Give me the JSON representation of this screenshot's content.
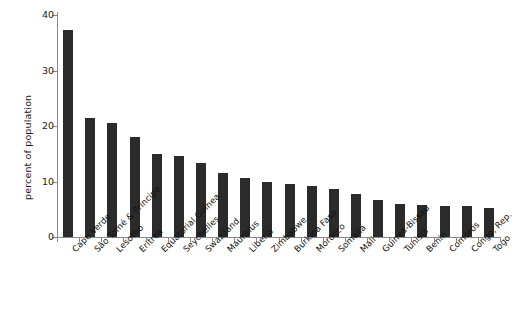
{
  "chart_data": {
    "type": "bar",
    "title": "",
    "xlabel": "",
    "ylabel": "percent of population",
    "ylim": [
      0,
      40
    ],
    "yticks": [
      0,
      10,
      20,
      30,
      40
    ],
    "grid": false,
    "legend": null,
    "bar_color": "#2b2b2b",
    "axis_color": "#8a8a8a",
    "categories": [
      "Cape Verde",
      "São Tomé & Príncipe",
      "Lesotho",
      "Eritrea",
      "Equatorial Guinea",
      "Seychelles",
      "Swaziland",
      "Mauritius",
      "Liberia",
      "Zimbabwe",
      "Burkina Faso",
      "Morocco",
      "Somalia",
      "Mali",
      "Guinea-Bissau",
      "Tunisia",
      "Benin",
      "Comoros",
      "Congo, Rep.",
      "Togo"
    ],
    "values": [
      37.3,
      21.5,
      20.5,
      18.0,
      14.9,
      14.6,
      13.3,
      11.6,
      10.7,
      9.9,
      9.6,
      9.2,
      8.6,
      7.7,
      6.6,
      6.0,
      5.7,
      5.6,
      5.5,
      5.3
    ]
  }
}
